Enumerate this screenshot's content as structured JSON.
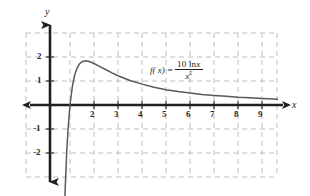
{
  "figure": {
    "kind": "cartesian-graph",
    "background": "#ffffff",
    "curve_color": "#58595b",
    "axis_color": "#231f20",
    "grid_color": "#bcbec0",
    "axis_labels": {
      "x": "x",
      "y": "y"
    },
    "formula": {
      "lhs": "f( x) =",
      "numerator_prefix": "10 ln",
      "numerator_var": "x",
      "denominator_var": "x",
      "denominator_exp": "2"
    }
  },
  "chart_data": {
    "type": "line",
    "title": "",
    "subtitle": "",
    "xlabel": "x",
    "ylabel": "y",
    "function": "f(x) = 10 ln x / x^2",
    "grid": true,
    "legend": false,
    "xlim": [
      -1,
      10
    ],
    "ylim": [
      -3,
      3
    ],
    "xticks": [
      2,
      3,
      4,
      5,
      6,
      7,
      8,
      9
    ],
    "yticks": [
      2,
      1,
      -1,
      -2
    ],
    "xtick_labels": [
      "2",
      "3",
      "4",
      "5",
      "6",
      "7",
      "8",
      "9"
    ],
    "ytick_labels": [
      "2",
      "1",
      "-1",
      "-2"
    ],
    "annotations": [
      {
        "text": "f( x) = 10 ln x / x²",
        "x": 4.2,
        "y": 1.35
      }
    ],
    "features": {
      "x_intercept": 1,
      "maximum_x": 1.649,
      "maximum_y": 1.839,
      "vertical_asymptote": 0,
      "horizontal_asymptote": 0
    },
    "x": [
      0.62,
      0.68,
      0.74,
      0.8,
      0.86,
      0.92,
      1.0,
      1.1,
      1.2,
      1.3,
      1.4,
      1.5,
      1.65,
      1.8,
      2.0,
      2.25,
      2.5,
      2.75,
      3.0,
      3.5,
      4.0,
      4.5,
      5.0,
      5.5,
      6.0,
      6.5,
      7.0,
      7.5,
      8.0,
      8.5,
      9.0,
      9.5,
      9.9
    ],
    "y": [
      -12.43,
      -8.34,
      -5.5,
      -3.49,
      -2.03,
      -0.99,
      0.0,
      0.79,
      1.27,
      1.55,
      1.72,
      1.8,
      1.84,
      1.81,
      1.73,
      1.6,
      1.47,
      1.34,
      1.22,
      1.02,
      0.87,
      0.74,
      0.64,
      0.56,
      0.5,
      0.44,
      0.4,
      0.36,
      0.32,
      0.3,
      0.27,
      0.25,
      0.23
    ]
  },
  "ticks": {
    "x": [
      {
        "label": "2",
        "px": 94
      },
      {
        "label": "3",
        "px": 118
      },
      {
        "label": "4",
        "px": 142
      },
      {
        "label": "5",
        "px": 166
      },
      {
        "label": "6",
        "px": 190
      },
      {
        "label": "7",
        "px": 214
      },
      {
        "label": "8",
        "px": 238
      },
      {
        "label": "9",
        "px": 262
      }
    ],
    "y": [
      {
        "label": "2",
        "py": 57
      },
      {
        "label": "1",
        "py": 81
      },
      {
        "label": "-1",
        "py": 129
      },
      {
        "label": "-2",
        "py": 153
      }
    ]
  }
}
